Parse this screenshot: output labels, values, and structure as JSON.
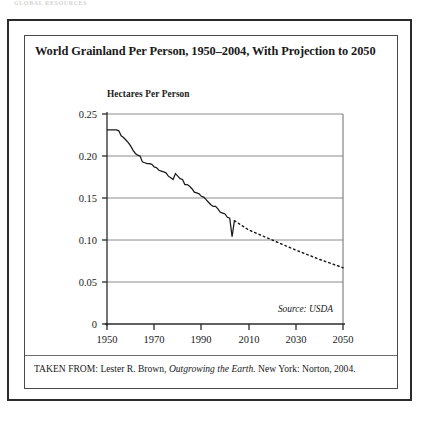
{
  "page": {
    "running_head": "GLOBAL RESOURCES"
  },
  "figure": {
    "title": "World Grainland Per Person, 1950–2004, With Projection to 2050",
    "axis_title": "Hectares Per Person",
    "source_note": "Source: USDA",
    "attribution_prefix": "TAKEN FROM: Lester R. Brown, ",
    "attribution_italic": "Outgrowing the Earth.",
    "attribution_suffix": " New York: Norton, 2004."
  },
  "chart_data": {
    "type": "line",
    "title": "World Grainland Per Person, 1950–2004, With Projection to 2050",
    "xlabel": "",
    "ylabel": "Hectares Per Person",
    "xlim": [
      1950,
      2050
    ],
    "ylim": [
      0,
      0.25
    ],
    "xticks": [
      1950,
      1970,
      1990,
      2010,
      2030,
      2050
    ],
    "xtick_labels": [
      "1950",
      "1970",
      "1990",
      "2010",
      "2030",
      "2050"
    ],
    "yticks": [
      0,
      0.05,
      0.1,
      0.15,
      0.2,
      0.25
    ],
    "ytick_labels": [
      "0",
      "0.05",
      "0.10",
      "0.15",
      "0.20",
      "0.25"
    ],
    "grid": "horizontal",
    "legend": "none",
    "annotations": [
      "Source: USDA"
    ],
    "series": [
      {
        "name": "Grainland per person (historical)",
        "style": "solid",
        "color": "#1a1a1a",
        "x": [
          1950,
          1951,
          1952,
          1953,
          1954,
          1955,
          1956,
          1957,
          1958,
          1959,
          1960,
          1961,
          1962,
          1963,
          1964,
          1965,
          1966,
          1967,
          1968,
          1969,
          1970,
          1971,
          1972,
          1973,
          1974,
          1975,
          1976,
          1977,
          1978,
          1979,
          1980,
          1981,
          1982,
          1983,
          1984,
          1985,
          1986,
          1987,
          1988,
          1989,
          1990,
          1991,
          1992,
          1993,
          1994,
          1995,
          1996,
          1997,
          1998,
          1999,
          2000,
          2001,
          2002,
          2003,
          2004
        ],
        "values": [
          0.231,
          0.231,
          0.231,
          0.231,
          0.231,
          0.23,
          0.224,
          0.222,
          0.219,
          0.216,
          0.212,
          0.207,
          0.203,
          0.201,
          0.2,
          0.193,
          0.192,
          0.191,
          0.191,
          0.19,
          0.187,
          0.186,
          0.183,
          0.182,
          0.181,
          0.18,
          0.176,
          0.174,
          0.172,
          0.179,
          0.176,
          0.173,
          0.172,
          0.166,
          0.166,
          0.164,
          0.161,
          0.157,
          0.156,
          0.155,
          0.152,
          0.151,
          0.148,
          0.145,
          0.142,
          0.14,
          0.14,
          0.137,
          0.133,
          0.132,
          0.131,
          0.127,
          0.126,
          0.104,
          0.123
        ]
      },
      {
        "name": "Projection",
        "style": "dotted",
        "color": "#1a1a1a",
        "x": [
          2004,
          2010,
          2020,
          2030,
          2040,
          2050
        ],
        "values": [
          0.123,
          0.112,
          0.1,
          0.088,
          0.077,
          0.067
        ]
      }
    ]
  }
}
